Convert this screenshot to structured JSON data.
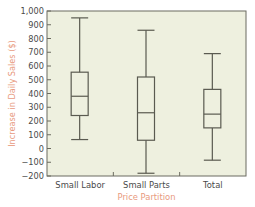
{
  "chart_data": {
    "type": "boxplot",
    "title": "",
    "xlabel": "Price Partition",
    "ylabel": "Increase in Daily Sales ($)",
    "ylim": [
      -200,
      1000
    ],
    "yticks": [
      -200,
      -100,
      0,
      100,
      200,
      300,
      400,
      500,
      600,
      700,
      800,
      900,
      1000
    ],
    "ytick_labels": [
      "−200",
      "−100",
      "0",
      "100",
      "200",
      "300",
      "400",
      "500",
      "600",
      "700",
      "800",
      "900",
      "1,000"
    ],
    "grid": false,
    "legend": null,
    "categories": [
      "Small Labor",
      "Small Parts",
      "Total"
    ],
    "series": [
      {
        "name": "Small Labor",
        "min": 65,
        "q1": 240,
        "median": 380,
        "q3": 555,
        "max": 950
      },
      {
        "name": "Small Parts",
        "min": -180,
        "q1": 60,
        "median": 260,
        "q3": 520,
        "max": 860
      },
      {
        "name": "Total",
        "min": -85,
        "q1": 150,
        "median": 250,
        "q3": 430,
        "max": 690
      }
    ]
  },
  "colors": {
    "plot_background": "#eef0df",
    "axis": "#6b6b60",
    "box_line": "#5a5a50",
    "tick_label": "#4a4a4a",
    "axis_label": "#e89a7e"
  }
}
